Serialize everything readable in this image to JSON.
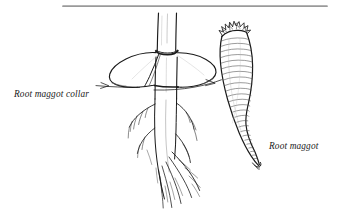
{
  "figure": {
    "kind": "line-drawing",
    "background_color": "#ffffff",
    "ink_color": "#1a1a1a",
    "rule_color": "#9a9a9a",
    "width": 339,
    "height": 221
  },
  "divider": {
    "name": "top-horizontal-rule",
    "x_start": 63,
    "x_end": 327,
    "y": 6,
    "thickness": 1.6,
    "color": "#9a9a9a"
  },
  "labels": {
    "collar": {
      "text": "Root maggot collar",
      "x": 14,
      "y": 89,
      "style": "italic-serif"
    },
    "maggot": {
      "text": "Root maggot",
      "x": 269,
      "y": 141,
      "style": "italic-serif"
    }
  },
  "leaders": {
    "collar": {
      "name": "leader-line-collar",
      "from_x": 96,
      "from_y": 86,
      "to_x": 140,
      "to_y": 88,
      "arrow": "right"
    },
    "maggot": {
      "name": "leader-line-maggot",
      "from_x": 155,
      "from_y": 90,
      "to_x": 221,
      "to_y": 84,
      "arrow": "right"
    }
  },
  "subjects": [
    {
      "name": "plant-stem",
      "description": "Vertical cylindrical stem entering the collar hole"
    },
    {
      "name": "root-maggot-collar",
      "description": "Flat circular disc split radially, laid flat on soil around the stem base"
    },
    {
      "name": "root-system",
      "description": "Taproot with fine branching lateral rootlets"
    },
    {
      "name": "root-maggot-larva",
      "description": "Curved tapering segmented maggot with crown of spiracular spines at the blunt end"
    }
  ]
}
